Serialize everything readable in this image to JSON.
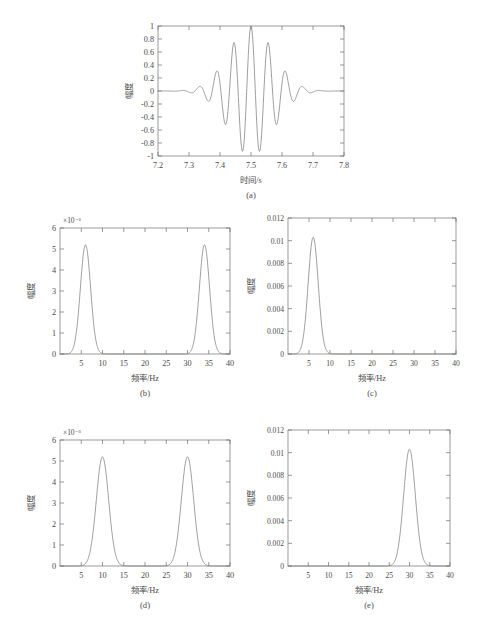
{
  "figure": {
    "background": "#ffffff",
    "curve_color": "#7d7d7d",
    "axis_color": "#6f6f6f"
  },
  "chart_data": [
    {
      "id": "a",
      "type": "line",
      "caption": "(a)",
      "title": "",
      "xlabel": "时间/s",
      "ylabel": "幅度",
      "xlim": [
        7.2,
        7.8
      ],
      "ylim": [
        -1,
        1
      ],
      "xticks": [
        "7.2",
        "7.3",
        "7.4",
        "7.5",
        "7.6",
        "7.7",
        "7.8"
      ],
      "xtick_values": [
        7.2,
        7.3,
        7.4,
        7.5,
        7.6,
        7.7,
        7.8
      ],
      "yticks": [
        "1",
        "0.8",
        "0.6",
        "0.4",
        "0.2",
        "0",
        "-0.2",
        "-0.4",
        "-0.6",
        "-0.8",
        "-1"
      ],
      "ytick_values": [
        1,
        0.8,
        0.6,
        0.4,
        0.2,
        0,
        -0.2,
        -0.4,
        -0.6,
        -0.8,
        -1
      ],
      "y_multiplier": "",
      "grid": false,
      "legend": "none",
      "description": "Morlet-like wavelet packet centred at 7.5 s",
      "waveform": {
        "center": 7.5,
        "peak": 1.0,
        "carrier_hz": 18,
        "envelope_sigma": 0.072,
        "side_minima": -0.74,
        "side_maxima": 0.33
      }
    },
    {
      "id": "b",
      "type": "line",
      "caption": "(b)",
      "title": "",
      "xlabel": "频率/Hz",
      "ylabel": "幅度",
      "xlim": [
        0,
        40
      ],
      "ylim": [
        0,
        6
      ],
      "y_multiplier": "×10⁻³",
      "xticks": [
        "5",
        "10",
        "15",
        "20",
        "25",
        "30",
        "35",
        "40"
      ],
      "xtick_values": [
        5,
        10,
        15,
        20,
        25,
        30,
        35,
        40
      ],
      "yticks": [
        "0",
        "1",
        "2",
        "3",
        "4",
        "5",
        "6"
      ],
      "ytick_values": [
        0,
        1,
        2,
        3,
        4,
        5,
        6
      ],
      "grid": false,
      "legend": "none",
      "peaks": [
        {
          "center_hz": 6,
          "amplitude": 5.2,
          "sigma_hz": 1.2
        },
        {
          "center_hz": 34,
          "amplitude": 5.2,
          "sigma_hz": 1.2
        }
      ]
    },
    {
      "id": "c",
      "type": "line",
      "caption": "(c)",
      "title": "",
      "xlabel": "频率/Hz",
      "ylabel": "幅度",
      "xlim": [
        0,
        40
      ],
      "ylim": [
        0,
        0.012
      ],
      "y_multiplier": "",
      "xticks": [
        "5",
        "10",
        "15",
        "20",
        "25",
        "30",
        "35",
        "40"
      ],
      "xtick_values": [
        5,
        10,
        15,
        20,
        25,
        30,
        35,
        40
      ],
      "yticks": [
        "0",
        "0.002",
        "0.004",
        "0.006",
        "0.008",
        "0.01",
        "0.012"
      ],
      "ytick_values": [
        0,
        0.002,
        0.004,
        0.006,
        0.008,
        0.01,
        0.012
      ],
      "grid": false,
      "legend": "none",
      "peaks": [
        {
          "center_hz": 6,
          "amplitude": 0.0103,
          "sigma_hz": 1.2
        }
      ]
    },
    {
      "id": "d",
      "type": "line",
      "caption": "(d)",
      "title": "",
      "xlabel": "频率/Hz",
      "ylabel": "幅度",
      "xlim": [
        0,
        40
      ],
      "ylim": [
        0,
        6
      ],
      "y_multiplier": "×10⁻³",
      "xticks": [
        "5",
        "10",
        "15",
        "20",
        "25",
        "30",
        "35",
        "40"
      ],
      "xtick_values": [
        5,
        10,
        15,
        20,
        25,
        30,
        35,
        40
      ],
      "yticks": [
        "0",
        "1",
        "2",
        "3",
        "4",
        "5",
        "6"
      ],
      "ytick_values": [
        0,
        1,
        2,
        3,
        4,
        5,
        6
      ],
      "grid": false,
      "legend": "none",
      "peaks": [
        {
          "center_hz": 10,
          "amplitude": 5.2,
          "sigma_hz": 1.45
        },
        {
          "center_hz": 30,
          "amplitude": 5.2,
          "sigma_hz": 1.45
        }
      ]
    },
    {
      "id": "e",
      "type": "line",
      "caption": "(e)",
      "title": "",
      "xlabel": "频率/Hz",
      "ylabel": "幅度",
      "xlim": [
        0,
        40
      ],
      "ylim": [
        0,
        0.012
      ],
      "y_multiplier": "",
      "xticks": [
        "5",
        "10",
        "15",
        "20",
        "25",
        "30",
        "35",
        "40"
      ],
      "xtick_values": [
        5,
        10,
        15,
        20,
        25,
        30,
        35,
        40
      ],
      "yticks": [
        "0",
        "0.002",
        "0.004",
        "0.006",
        "0.008",
        "0.01",
        "0.012"
      ],
      "ytick_values": [
        0,
        0.002,
        0.004,
        0.006,
        0.008,
        0.01,
        0.012
      ],
      "grid": false,
      "legend": "none",
      "peaks": [
        {
          "center_hz": 30,
          "amplitude": 0.0103,
          "sigma_hz": 1.45
        }
      ]
    }
  ]
}
